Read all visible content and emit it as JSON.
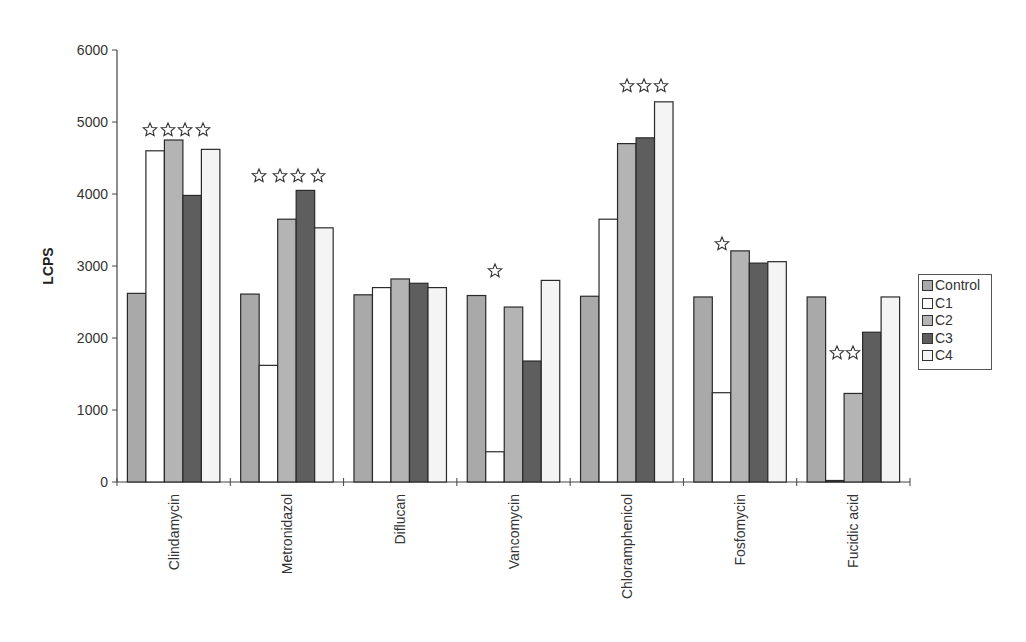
{
  "chart_data": {
    "type": "bar",
    "title": "",
    "xlabel": "",
    "ylabel": "LCPS",
    "ylim": [
      0,
      6000
    ],
    "yticks": [
      0,
      1000,
      2000,
      3000,
      4000,
      5000,
      6000
    ],
    "grid": false,
    "legend_position": "right",
    "categories": [
      "Clindamycin",
      "Metronidazol",
      "Diflucan",
      "Vancomycin",
      "Chloramphenicol",
      "Fosfomycin",
      "Fucidic acid"
    ],
    "series": [
      {
        "name": "Control",
        "color": "#a9a9a9",
        "values": [
          2620,
          2610,
          2600,
          2590,
          2580,
          2570,
          2570
        ]
      },
      {
        "name": "C1",
        "color": "#ffffff",
        "values": [
          4600,
          1620,
          2700,
          420,
          3650,
          1240,
          0
        ]
      },
      {
        "name": "C2",
        "color": "#b4b4b4",
        "values": [
          4750,
          3650,
          2820,
          2430,
          4700,
          3210,
          1230
        ]
      },
      {
        "name": "C3",
        "color": "#5e5e5e",
        "values": [
          3980,
          4050,
          2760,
          1680,
          4780,
          3040,
          2080
        ]
      },
      {
        "name": "C4",
        "color": "#f4f4f4",
        "values": [
          4620,
          3530,
          2700,
          2800,
          5280,
          3060,
          2570
        ]
      }
    ],
    "annotations": {
      "symbol": "☆",
      "significance_stars": [
        {
          "category": "Clindamycin",
          "count": 4
        },
        {
          "category": "Metronidazol",
          "count": 4
        },
        {
          "category": "Vancomycin",
          "count": 1
        },
        {
          "category": "Chloramphenicol",
          "count": 3
        },
        {
          "category": "Fosfomycin",
          "count": 1
        },
        {
          "category": "Fucidic acid",
          "count": 2
        }
      ]
    }
  },
  "legend": {
    "items": [
      {
        "label": "Control",
        "color": "#a9a9a9"
      },
      {
        "label": "C1",
        "color": "#ffffff"
      },
      {
        "label": "C2",
        "color": "#b4b4b4"
      },
      {
        "label": "C3",
        "color": "#5e5e5e"
      },
      {
        "label": "C4",
        "color": "#f4f4f4"
      }
    ]
  }
}
